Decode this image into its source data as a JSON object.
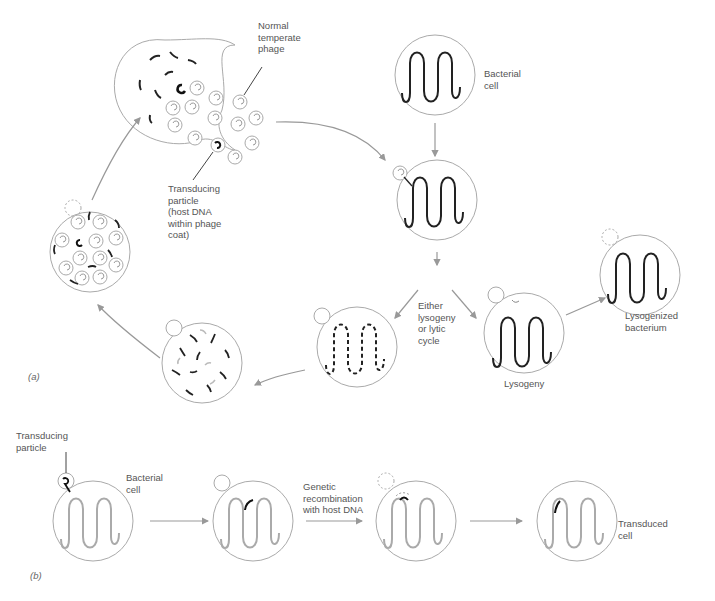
{
  "figure": {
    "panel_a_label": "(a)",
    "panel_b_label": "(b)"
  },
  "labels": {
    "normal_phage": "Normal\ntemperate\nphage",
    "transducing_particle_a": "Transducing\nparticle\n(host DNA\nwithin phage\ncoat)",
    "bacterial_cell_a": "Bacterial\ncell",
    "either": "Either\nlysogeny\nor lytic\ncycle",
    "lysogeny": "Lysogeny",
    "lysogenized": "Lysogenized\nbacterium",
    "transducing_particle_b": "Transducing\nparticle",
    "bacterial_cell_b": "Bacterial\ncell",
    "recombination": "Genetic\nrecombination\nwith host DNA",
    "transduced": "Transduced\ncell"
  },
  "colors": {
    "outline": "#aaaaaa",
    "dna": "#222222",
    "arrow": "#999999"
  }
}
